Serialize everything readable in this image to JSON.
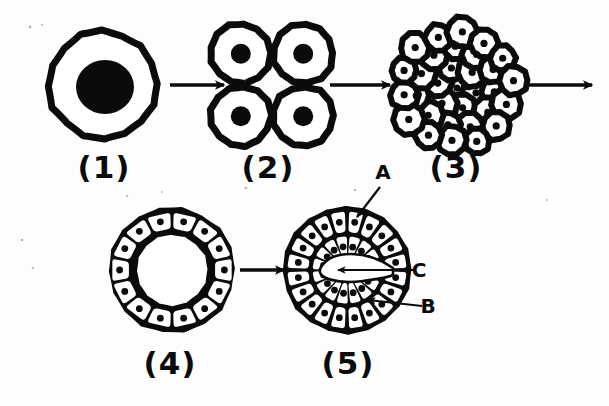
{
  "figure": {
    "background_color": "#fdfdfd",
    "ink_color": "#0b0b0b",
    "width": 609,
    "height": 406
  },
  "stages": [
    {
      "id": "stage-1",
      "caption": "(1)",
      "name": "zygote",
      "caption_x": 104,
      "caption_y": 178,
      "center_x": 103,
      "center_y": 85,
      "outer_radius": 54,
      "stroke_width": 7,
      "nucleus_radius": 27,
      "cell_count": 1
    },
    {
      "id": "stage-2",
      "caption": "(2)",
      "name": "four-cell-stage",
      "caption_x": 268,
      "caption_y": 178,
      "center_x": 272,
      "center_y": 85,
      "cell_count": 4,
      "cell_radius": 30,
      "stroke_width": 7,
      "nucleus_radius": 10
    },
    {
      "id": "stage-3",
      "caption": "(3)",
      "name": "morula",
      "caption_x": 456,
      "caption_y": 178,
      "center_x": 457,
      "center_y": 88,
      "cluster_radius": 63,
      "cell_count": 28,
      "cell_radius": 14,
      "stroke_width": 6,
      "nucleus_radius": 3.6
    },
    {
      "id": "stage-4",
      "caption": "(4)",
      "name": "blastula",
      "caption_x": 170,
      "caption_y": 374,
      "center_x": 172,
      "center_y": 270,
      "outer_radius": 62,
      "inner_radius": 38,
      "cell_count": 14,
      "stroke_width": 6,
      "nucleus_radius": 3.4
    },
    {
      "id": "stage-5",
      "caption": "(5)",
      "name": "gastrula",
      "caption_x": 348,
      "caption_y": 374,
      "center_x": 347,
      "center_y": 270,
      "outer_radius": 63,
      "stroke_width": 6,
      "nucleus_radius": 3.4,
      "outer_cell_count": 20,
      "inner_cell_count": 14
    }
  ],
  "arrows": [
    {
      "id": "arrow-1-to-2",
      "x1": 170,
      "y1": 85,
      "x2": 224,
      "y2": 85
    },
    {
      "id": "arrow-2-to-3",
      "x1": 330,
      "y1": 85,
      "x2": 390,
      "y2": 85
    },
    {
      "id": "arrow-3-to-next",
      "x1": 528,
      "y1": 85,
      "x2": 592,
      "y2": 85
    },
    {
      "id": "arrow-4-to-5",
      "x1": 240,
      "y1": 270,
      "x2": 284,
      "y2": 270
    }
  ],
  "labels": [
    {
      "id": "label-a",
      "text": "A",
      "meaning": "ectoderm-outer-cell-layer",
      "text_x": 383,
      "text_y": 179,
      "leader": {
        "x1": 380,
        "y1": 187,
        "x2": 357,
        "y2": 217
      }
    },
    {
      "id": "label-c",
      "text": "C",
      "meaning": "archenteron-cavity",
      "text_x": 419,
      "text_y": 277,
      "leader": {
        "x1": 413,
        "y1": 270,
        "x2": 338,
        "y2": 270
      }
    },
    {
      "id": "label-b",
      "text": "B",
      "meaning": "endoderm-inner-cell-layer",
      "text_x": 428,
      "text_y": 313,
      "leader": {
        "x1": 422,
        "y1": 306,
        "x2": 368,
        "y2": 300
      }
    }
  ],
  "specks": [
    {
      "x": 30,
      "y": 27,
      "r": 1.4
    },
    {
      "x": 42,
      "y": 25,
      "r": 1.1
    },
    {
      "x": 67,
      "y": 48,
      "r": 1.2
    },
    {
      "x": 246,
      "y": 188,
      "r": 1.3
    },
    {
      "x": 355,
      "y": 190,
      "r": 1.2
    },
    {
      "x": 22,
      "y": 240,
      "r": 1.3
    },
    {
      "x": 33,
      "y": 268,
      "r": 1.1
    },
    {
      "x": 162,
      "y": 192,
      "r": 1.0
    },
    {
      "x": 127,
      "y": 196,
      "r": 1.1
    },
    {
      "x": 547,
      "y": 200,
      "r": 1.1
    }
  ]
}
